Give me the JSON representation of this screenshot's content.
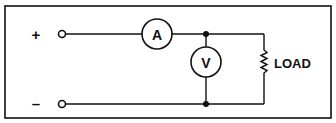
{
  "diagram": {
    "type": "circuit",
    "terminals": [
      {
        "label": "+",
        "polarity": "positive"
      },
      {
        "label": "–",
        "polarity": "negative"
      }
    ],
    "ammeter": {
      "label": "A"
    },
    "voltmeter": {
      "label": "V"
    },
    "load": {
      "label": "LOAD"
    },
    "colors": {
      "line": "#111111",
      "background": "#ffffff"
    }
  }
}
